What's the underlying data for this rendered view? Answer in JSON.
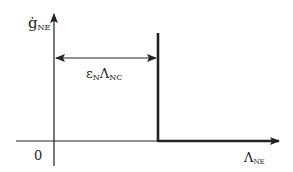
{
  "diagram": {
    "y_axis_label": {
      "main": "ġ",
      "sub": "NE"
    },
    "x_axis_label": {
      "main": "Λ",
      "sub": "NE"
    },
    "origin_label": "0",
    "span_label": {
      "eps": "ε",
      "eps_sub": "N",
      "lam": "Λ",
      "lam_sub": "NC"
    },
    "colors": {
      "stroke": "#222222",
      "background": "#ffffff"
    }
  }
}
